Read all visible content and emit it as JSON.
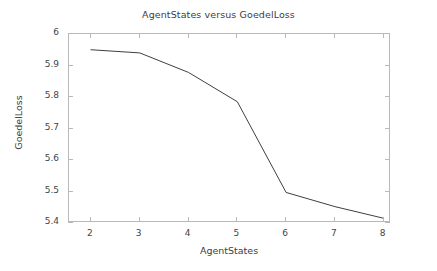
{
  "chart_data": {
    "type": "line",
    "title": "AgentStates versus GoedelLoss",
    "xlabel": "AgentStates",
    "ylabel": "GoedelLoss",
    "x": [
      2,
      3,
      4,
      5,
      6,
      7,
      8
    ],
    "values": [
      5.95,
      5.94,
      5.878,
      5.785,
      5.497,
      5.452,
      5.415
    ],
    "series": [
      {
        "name": "GoedelLoss",
        "values": [
          5.95,
          5.94,
          5.878,
          5.785,
          5.497,
          5.452,
          5.415
        ],
        "color": "#3f3f3f",
        "line_width": 1,
        "markers": "none"
      }
    ],
    "xlim": [
      1.55,
      8.15
    ],
    "ylim": [
      5.4,
      6.0
    ],
    "xticks": [
      2,
      3,
      4,
      5,
      6,
      7,
      8
    ],
    "xtick_labels": [
      "2",
      "3",
      "4",
      "5",
      "6",
      "7",
      "8"
    ],
    "yticks": [
      5.4,
      5.5,
      5.6,
      5.7,
      5.8,
      5.9,
      6.0
    ],
    "ytick_labels": [
      "5.4",
      "5.5",
      "5.6",
      "5.7",
      "5.8",
      "5.9",
      "6"
    ],
    "grid": false,
    "legend": null,
    "legend_position": "none",
    "frame_color": "#b9b9b9",
    "text_color": "#3d3d3d",
    "background": "#ffffff"
  }
}
